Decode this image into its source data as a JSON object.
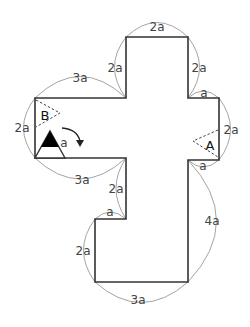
{
  "diagram": {
    "type": "cross-shaped polygon with dimension arcs",
    "unit": "a",
    "outline_points": [
      [
        126,
        37
      ],
      [
        188,
        37
      ],
      [
        188,
        98
      ],
      [
        219,
        98
      ],
      [
        219,
        160
      ],
      [
        188,
        160
      ],
      [
        188,
        282
      ],
      [
        95,
        282
      ],
      [
        95,
        219
      ],
      [
        126,
        219
      ],
      [
        126,
        158
      ],
      [
        35,
        158
      ],
      [
        35,
        98
      ],
      [
        126,
        98
      ]
    ],
    "dimensions": [
      {
        "id": "top",
        "label": "2a"
      },
      {
        "id": "upper-left-vertical",
        "label": "2a"
      },
      {
        "id": "upper-right-vertical",
        "label": "2a"
      },
      {
        "id": "left-arm-top",
        "label": "3a"
      },
      {
        "id": "right-step-top",
        "label": "a"
      },
      {
        "id": "left-end",
        "label": "2a"
      },
      {
        "id": "right-end",
        "label": "2a"
      },
      {
        "id": "left-arm-bottom",
        "label": "3a"
      },
      {
        "id": "right-step-bottom",
        "label": "a"
      },
      {
        "id": "lower-inner-vertical",
        "label": "2a"
      },
      {
        "id": "lower-step",
        "label": "a"
      },
      {
        "id": "lower-left-vertical",
        "label": "2a"
      },
      {
        "id": "right-long-vertical",
        "label": "4a"
      },
      {
        "id": "bottom",
        "label": "3a"
      }
    ],
    "points": {
      "A": {
        "label": "A"
      },
      "B": {
        "label": "B"
      }
    },
    "triangle": {
      "side_label": "a",
      "fill_color": "#000000"
    },
    "rotation_arrow": {
      "direction": "clockwise"
    }
  }
}
